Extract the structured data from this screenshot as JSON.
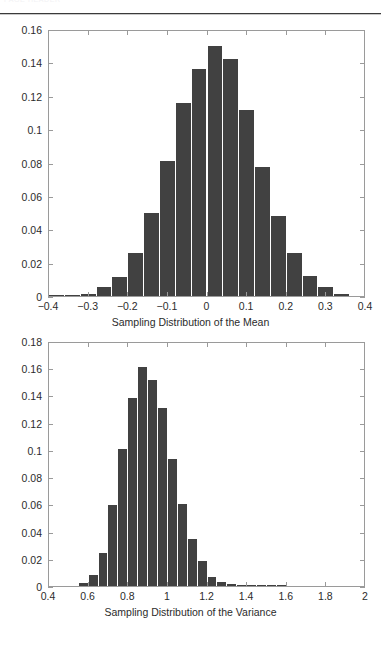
{
  "page": {
    "header_ghost_text": "PAGE HEADER",
    "background_color": "#ffffff",
    "bar_color": "#414141",
    "axis_color": "#9a9a9a"
  },
  "chart_data": [
    {
      "type": "bar",
      "name": "sampling-distribution-of-the-mean",
      "title": "",
      "xlabel": "Sampling Distribution of the Mean",
      "ylabel": "",
      "xlim": [
        -0.4,
        0.4
      ],
      "ylim": [
        0,
        0.16
      ],
      "grid": false,
      "legend": null,
      "xticks": [
        -0.4,
        -0.3,
        -0.2,
        -0.1,
        0,
        0.1,
        0.2,
        0.3,
        0.4
      ],
      "xtick_labels": [
        "−0.4",
        "−0.3",
        "−0.2",
        "−0.1",
        "0",
        "0.1",
        "0.2",
        "0.3",
        "0.4"
      ],
      "yticks": [
        0,
        0.02,
        0.04,
        0.06,
        0.08,
        0.1,
        0.12,
        0.14,
        0.16
      ],
      "ytick_labels": [
        "0",
        "0.02",
        "0.04",
        "0.06",
        "0.08",
        "0.1",
        "0.12",
        "0.14",
        "0.16"
      ],
      "bin_width": 0.04,
      "x": [
        -0.38,
        -0.34,
        -0.3,
        -0.26,
        -0.22,
        -0.18,
        -0.14,
        -0.1,
        -0.06,
        -0.02,
        0.02,
        0.06,
        0.1,
        0.14,
        0.18,
        0.22,
        0.26,
        0.3,
        0.34
      ],
      "values": [
        0.0005,
        0.0008,
        0.0015,
        0.0057,
        0.0115,
        0.026,
        0.0495,
        0.081,
        0.1155,
        0.136,
        0.15,
        0.142,
        0.1115,
        0.0775,
        0.048,
        0.0255,
        0.012,
        0.0057,
        0.0013
      ]
    },
    {
      "type": "bar",
      "name": "sampling-distribution-of-the-variance",
      "title": "",
      "xlabel": "Sampling Distribution of the Variance",
      "ylabel": "",
      "xlim": [
        0.4,
        2.0
      ],
      "ylim": [
        0,
        0.18
      ],
      "grid": false,
      "legend": null,
      "xticks": [
        0.4,
        0.6,
        0.8,
        1.0,
        1.2,
        1.4,
        1.6,
        1.8,
        2.0
      ],
      "xtick_labels": [
        "0.4",
        "0.6",
        "0.8",
        "1",
        "1.2",
        "1.4",
        "1.6",
        "1.8",
        "2"
      ],
      "yticks": [
        0,
        0.02,
        0.04,
        0.06,
        0.08,
        0.1,
        0.12,
        0.14,
        0.16,
        0.18
      ],
      "ytick_labels": [
        "0",
        "0.02",
        "0.04",
        "0.06",
        "0.08",
        "0.1",
        "0.12",
        "0.14",
        "0.16",
        "0.18"
      ],
      "bin_width": 0.05,
      "x": [
        0.575,
        0.625,
        0.675,
        0.725,
        0.775,
        0.825,
        0.875,
        0.925,
        0.975,
        1.025,
        1.075,
        1.125,
        1.175,
        1.225,
        1.275,
        1.325,
        1.375,
        1.425,
        1.475,
        1.525,
        1.575
      ],
      "values": [
        0.002,
        0.008,
        0.0245,
        0.0598,
        0.1005,
        0.1378,
        0.1608,
        0.1512,
        0.1305,
        0.093,
        0.0605,
        0.0348,
        0.0182,
        0.0065,
        0.003,
        0.0012,
        0.0006,
        0.0003,
        0.0002,
        0.0001,
        0.0001
      ]
    }
  ]
}
